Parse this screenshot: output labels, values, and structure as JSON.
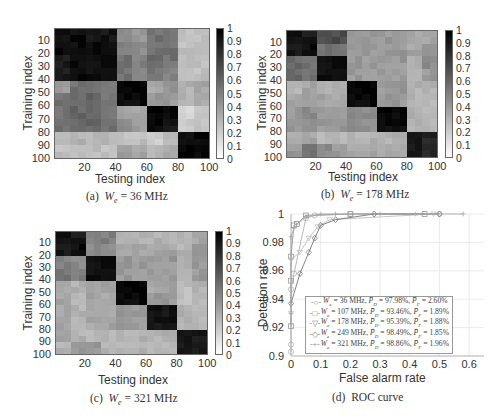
{
  "panels": [
    {
      "id": "a",
      "caption_prefix": "(a)",
      "caption_var": "W",
      "caption_sub": "e",
      "caption_value": "= 36 MHz",
      "xlabel": "Testing index",
      "ylabel": "Training index",
      "xticks": [
        "20",
        "40",
        "60",
        "80",
        "100"
      ],
      "yticks": [
        "10",
        "20",
        "30",
        "40",
        "50",
        "60",
        "70",
        "80",
        "90",
        "100"
      ],
      "cbar_ticks": [
        "1",
        "0.9",
        "0.8",
        "0.7",
        "0.6",
        "0.5",
        "0.4",
        "0.3",
        "0.2",
        "0.1",
        "0"
      ]
    },
    {
      "id": "b",
      "caption_prefix": "(b)",
      "caption_var": "W",
      "caption_sub": "e",
      "caption_value": "= 178 MHz",
      "xlabel": "Testing index",
      "ylabel": "Training index",
      "xticks": [
        "20",
        "40",
        "60",
        "80",
        "100"
      ],
      "yticks": [
        "10",
        "20",
        "30",
        "40",
        "50",
        "60",
        "70",
        "80",
        "90",
        "100"
      ],
      "cbar_ticks": [
        "1",
        "0.9",
        "0.8",
        "0.7",
        "0.6",
        "0.5",
        "0.4",
        "0.3",
        "0.2",
        "0.1",
        "0"
      ]
    },
    {
      "id": "c",
      "caption_prefix": "(c)",
      "caption_var": "W",
      "caption_sub": "e",
      "caption_value": "= 321 MHz",
      "xlabel": "Testing index",
      "ylabel": "Training index",
      "xticks": [
        "20",
        "40",
        "60",
        "80",
        "100"
      ],
      "yticks": [
        "10",
        "20",
        "30",
        "40",
        "50",
        "60",
        "70",
        "80",
        "90",
        "100"
      ],
      "cbar_ticks": [
        "1",
        "0.9",
        "0.8",
        "0.7",
        "0.6",
        "0.5",
        "0.4",
        "0.3",
        "0.2",
        "0.1",
        "0"
      ]
    },
    {
      "id": "d",
      "caption_prefix": "(d)",
      "caption_text": "ROC curve",
      "xlabel": "False alarm rate",
      "ylabel": "Detetion rate",
      "xticks": [
        "0",
        "0.1",
        "0.2",
        "0.3",
        "0.4",
        "0.5",
        "0.6"
      ],
      "yticks": [
        "1",
        "0.98",
        "0.96",
        "0.94",
        "0.92",
        "0.9"
      ]
    }
  ],
  "chart_data": [
    {
      "type": "heatmap",
      "title": "(a) We = 36 MHz",
      "xlabel": "Testing index",
      "ylabel": "Training index",
      "x_range": [
        1,
        100
      ],
      "y_range": [
        1,
        100
      ],
      "colorbar_range": [
        0,
        1
      ],
      "colormap": "gray_r",
      "block_size": 10,
      "blocks": [
        [
          0.95,
          0.95,
          0.92,
          0.92,
          0.45,
          0.4,
          0.55,
          0.55,
          0.25,
          0.25
        ],
        [
          0.95,
          0.95,
          0.95,
          0.95,
          0.5,
          0.45,
          0.55,
          0.55,
          0.25,
          0.25
        ],
        [
          0.9,
          0.95,
          0.95,
          0.95,
          0.55,
          0.5,
          0.6,
          0.55,
          0.25,
          0.25
        ],
        [
          0.9,
          0.95,
          0.95,
          0.95,
          0.55,
          0.5,
          0.55,
          0.5,
          0.25,
          0.25
        ],
        [
          0.4,
          0.55,
          0.55,
          0.5,
          0.97,
          0.97,
          0.35,
          0.4,
          0.3,
          0.35
        ],
        [
          0.55,
          0.6,
          0.6,
          0.55,
          0.97,
          0.97,
          0.4,
          0.4,
          0.3,
          0.35
        ],
        [
          0.55,
          0.6,
          0.6,
          0.55,
          0.35,
          0.35,
          0.97,
          0.97,
          0.15,
          0.25
        ],
        [
          0.55,
          0.6,
          0.6,
          0.55,
          0.45,
          0.4,
          0.97,
          0.9,
          0.2,
          0.25
        ],
        [
          0.25,
          0.3,
          0.3,
          0.3,
          0.25,
          0.25,
          0.2,
          0.25,
          0.97,
          0.97
        ],
        [
          0.25,
          0.25,
          0.25,
          0.25,
          0.4,
          0.35,
          0.3,
          0.35,
          0.97,
          0.97
        ]
      ]
    },
    {
      "type": "heatmap",
      "title": "(b) We = 178 MHz",
      "xlabel": "Testing index",
      "ylabel": "Training index",
      "x_range": [
        1,
        100
      ],
      "y_range": [
        1,
        100
      ],
      "colorbar_range": [
        0,
        1
      ],
      "colormap": "gray_r",
      "block_size": 10,
      "blocks": [
        [
          0.95,
          0.9,
          0.7,
          0.7,
          0.4,
          0.4,
          0.4,
          0.4,
          0.35,
          0.35
        ],
        [
          0.9,
          0.95,
          0.55,
          0.55,
          0.4,
          0.4,
          0.4,
          0.4,
          0.35,
          0.4
        ],
        [
          0.6,
          0.55,
          0.95,
          0.95,
          0.4,
          0.4,
          0.4,
          0.4,
          0.3,
          0.45
        ],
        [
          0.6,
          0.55,
          0.95,
          0.95,
          0.4,
          0.4,
          0.4,
          0.4,
          0.3,
          0.4
        ],
        [
          0.3,
          0.35,
          0.3,
          0.3,
          0.97,
          0.97,
          0.4,
          0.4,
          0.3,
          0.3
        ],
        [
          0.35,
          0.4,
          0.35,
          0.35,
          0.97,
          0.97,
          0.4,
          0.4,
          0.3,
          0.3
        ],
        [
          0.4,
          0.45,
          0.4,
          0.4,
          0.45,
          0.45,
          0.97,
          0.97,
          0.3,
          0.3
        ],
        [
          0.4,
          0.45,
          0.4,
          0.4,
          0.45,
          0.45,
          0.95,
          0.95,
          0.3,
          0.3
        ],
        [
          0.3,
          0.35,
          0.3,
          0.3,
          0.3,
          0.3,
          0.3,
          0.3,
          0.95,
          0.85
        ],
        [
          0.4,
          0.55,
          0.45,
          0.4,
          0.35,
          0.35,
          0.35,
          0.35,
          0.9,
          0.85
        ]
      ]
    },
    {
      "type": "heatmap",
      "title": "(c) We = 321 MHz",
      "xlabel": "Testing index",
      "ylabel": "Training index",
      "x_range": [
        1,
        100
      ],
      "y_range": [
        1,
        100
      ],
      "colorbar_range": [
        0,
        1
      ],
      "colormap": "gray_r",
      "block_size": 10,
      "blocks": [
        [
          0.95,
          0.9,
          0.5,
          0.5,
          0.3,
          0.3,
          0.3,
          0.3,
          0.3,
          0.35
        ],
        [
          0.9,
          0.95,
          0.45,
          0.45,
          0.35,
          0.35,
          0.35,
          0.35,
          0.3,
          0.4
        ],
        [
          0.5,
          0.45,
          0.95,
          0.95,
          0.4,
          0.4,
          0.4,
          0.4,
          0.3,
          0.4
        ],
        [
          0.55,
          0.5,
          0.95,
          0.95,
          0.4,
          0.4,
          0.4,
          0.4,
          0.3,
          0.4
        ],
        [
          0.35,
          0.3,
          0.35,
          0.35,
          0.97,
          0.97,
          0.35,
          0.35,
          0.25,
          0.3
        ],
        [
          0.35,
          0.3,
          0.35,
          0.35,
          0.97,
          0.97,
          0.4,
          0.4,
          0.25,
          0.3
        ],
        [
          0.35,
          0.3,
          0.35,
          0.35,
          0.4,
          0.4,
          0.92,
          0.92,
          0.3,
          0.3
        ],
        [
          0.35,
          0.3,
          0.35,
          0.35,
          0.4,
          0.4,
          0.92,
          0.92,
          0.3,
          0.3
        ],
        [
          0.35,
          0.3,
          0.3,
          0.3,
          0.3,
          0.3,
          0.3,
          0.3,
          0.95,
          0.9
        ],
        [
          0.3,
          0.4,
          0.4,
          0.3,
          0.3,
          0.3,
          0.3,
          0.3,
          0.9,
          0.9
        ]
      ]
    },
    {
      "type": "line",
      "title": "(d) ROC curve",
      "xlabel": "False alarm rate",
      "ylabel": "Detetion rate",
      "xlim": [
        0,
        0.65
      ],
      "ylim": [
        0.9,
        1.0
      ],
      "xticks": [
        0,
        0.1,
        0.2,
        0.3,
        0.4,
        0.5,
        0.6
      ],
      "yticks": [
        0.9,
        0.92,
        0.94,
        0.96,
        0.98,
        1
      ],
      "grid": true,
      "legend_position": "lower right",
      "series": [
        {
          "name": "We = 36 MHz, PD = 97.98%, PF = 2.60%",
          "marker": "circle",
          "x": [
            0,
            0,
            0,
            0.01,
            0.05,
            0.08,
            0.2,
            0.5
          ],
          "y": [
            0.903,
            0.908,
            0.947,
            0.958,
            0.997,
            0.999,
            1.0,
            1.0
          ]
        },
        {
          "name": "We = 107 MHz, PD = 93.46%, PF = 1.89%",
          "marker": "square",
          "x": [
            0,
            0,
            0,
            0.01,
            0.02,
            0.05,
            0.2,
            0.45
          ],
          "y": [
            0.921,
            0.953,
            0.97,
            0.992,
            0.993,
            0.999,
            1.0,
            1.0
          ]
        },
        {
          "name": "We = 178 MHz, PD = 95.39%, PF = 1.88%",
          "marker": "triangle-down",
          "x": [
            0,
            0,
            0.03,
            0.06,
            0.09,
            0.13,
            0.48
          ],
          "y": [
            0.93,
            0.968,
            0.973,
            0.983,
            0.991,
            0.996,
            1.0
          ]
        },
        {
          "name": "We = 249 MHz, PD = 98.49%, PF = 1.85%",
          "marker": "diamond",
          "x": [
            0,
            0.03,
            0.06,
            0.08,
            0.1,
            0.15,
            0.28,
            0.5
          ],
          "y": [
            0.937,
            0.958,
            0.973,
            0.983,
            0.992,
            0.996,
            1.0,
            1.0
          ]
        },
        {
          "name": "We = 321 MHz, PD = 98.86%, PF = 1.96%",
          "marker": "plus",
          "x": [
            0,
            0,
            0.01,
            0.05,
            0.1,
            0.15,
            0.3,
            0.42,
            0.58
          ],
          "y": [
            0.93,
            0.984,
            0.99,
            0.998,
            1.0,
            1.0,
            1.0,
            1.0,
            1.0
          ]
        }
      ]
    }
  ],
  "legend": [
    {
      "marker": "circle-icon",
      "glyph": "○",
      "we": "36 MHz",
      "pd": "97.98%",
      "pf": "2.60%"
    },
    {
      "marker": "square-icon",
      "glyph": "□",
      "we": "107 MHz",
      "pd": "93.46%",
      "pf": "1.89%"
    },
    {
      "marker": "triangle-down-icon",
      "glyph": "▽",
      "we": "178 MHz",
      "pd": "95.39%",
      "pf": "1.88%"
    },
    {
      "marker": "diamond-icon",
      "glyph": "◇",
      "we": "249 MHz",
      "pd": "98.49%",
      "pf": "1.85%"
    },
    {
      "marker": "plus-icon",
      "glyph": "+",
      "we": "321 MHz",
      "pd": "98.86%",
      "pf": "1.96%"
    }
  ]
}
